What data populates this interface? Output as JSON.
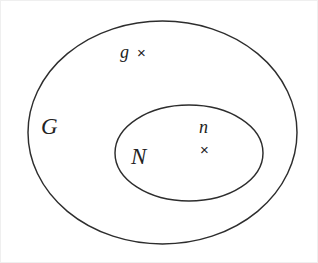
{
  "diagram": {
    "kind": "set-containment-diagram",
    "background_color": "#ffffff",
    "stroke_color": "#2d2d2d",
    "text_color": "#232323",
    "outer_set": {
      "label": "G",
      "shape": "ellipse",
      "cx": 161.5,
      "cy": 131.5,
      "rx": 134.5,
      "ry": 111.5
    },
    "inner_set": {
      "label": "N",
      "shape": "ellipse",
      "cx": 188,
      "cy": 152,
      "rx": 74,
      "ry": 48
    },
    "elements": [
      {
        "label": "g",
        "marker": "×",
        "marker_name": "cross-marker",
        "region": "outer_set_only",
        "marker_position": "right-of-label"
      },
      {
        "label": "n",
        "marker": "×",
        "marker_name": "cross-marker",
        "region": "inner_set",
        "marker_position": "below-label"
      }
    ]
  }
}
